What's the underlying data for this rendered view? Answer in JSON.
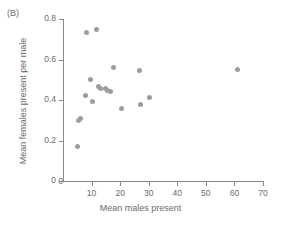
{
  "panel": {
    "label": "(B)"
  },
  "chart_data": {
    "type": "scatter",
    "title": "",
    "xlabel": "Mean males present",
    "ylabel": "Mean females present per male",
    "xlim": [
      0,
      70
    ],
    "ylim": [
      0,
      0.8
    ],
    "xticks": [
      0,
      10,
      20,
      30,
      40,
      50,
      60,
      70
    ],
    "xticklabels": [
      "0",
      "10",
      "20",
      "30",
      "40",
      "50",
      "60",
      "70"
    ],
    "yticks": [
      0,
      0.2,
      0.4,
      0.6,
      0.8
    ],
    "yticklabels": [
      "0",
      "0.2",
      "0.4",
      "0.6",
      "0.8"
    ],
    "grid": false,
    "legend": null,
    "marker": {
      "shape": "circle",
      "color": "#9d9d9d",
      "size": 5
    },
    "points": [
      {
        "x": 5.0,
        "y": 0.17
      },
      {
        "x": 5.4,
        "y": 0.298
      },
      {
        "x": 6.2,
        "y": 0.307
      },
      {
        "x": 7.9,
        "y": 0.42
      },
      {
        "x": 8.1,
        "y": 0.735
      },
      {
        "x": 9.6,
        "y": 0.5
      },
      {
        "x": 10.2,
        "y": 0.395
      },
      {
        "x": 11.6,
        "y": 0.75
      },
      {
        "x": 12.4,
        "y": 0.468
      },
      {
        "x": 13.0,
        "y": 0.458
      },
      {
        "x": 14.8,
        "y": 0.455
      },
      {
        "x": 15.4,
        "y": 0.448
      },
      {
        "x": 16.6,
        "y": 0.44
      },
      {
        "x": 17.5,
        "y": 0.562
      },
      {
        "x": 20.6,
        "y": 0.356
      },
      {
        "x": 26.6,
        "y": 0.545
      },
      {
        "x": 27.2,
        "y": 0.377
      },
      {
        "x": 30.4,
        "y": 0.41
      },
      {
        "x": 61.2,
        "y": 0.55
      }
    ]
  }
}
